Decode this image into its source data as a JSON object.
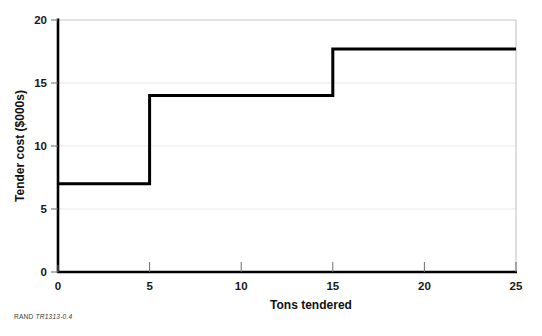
{
  "figure": {
    "source_note_prefix": "RAND",
    "source_note_id": "TR1313-0.4"
  },
  "chart_data": {
    "type": "line",
    "subtype": "step",
    "title": "",
    "xlabel": "Tons tendered",
    "ylabel": "Tender cost ($000s)",
    "xlim": [
      0,
      25
    ],
    "ylim": [
      0,
      20
    ],
    "xticks": [
      0,
      5,
      10,
      15,
      20,
      25
    ],
    "yticks": [
      0,
      5,
      10,
      15,
      20
    ],
    "xtick_labels": [
      "0",
      "5",
      "10",
      "15",
      "20",
      "25"
    ],
    "ytick_labels": [
      "0",
      "5",
      "10",
      "15",
      "20"
    ],
    "grid": "horizontal",
    "legend": "none",
    "series": [
      {
        "name": "Tender cost",
        "color": "#000000",
        "step_mode": "post",
        "x": [
          0,
          5,
          5,
          15,
          15,
          25
        ],
        "y": [
          7,
          7,
          14,
          14,
          17.7,
          17.7
        ],
        "breakpoints": [
          {
            "x_start": 0,
            "x_end": 5,
            "value": 7
          },
          {
            "x_start": 5,
            "x_end": 15,
            "value": 14
          },
          {
            "x_start": 15,
            "x_end": 25,
            "value": 17.7
          }
        ]
      }
    ],
    "colors": {
      "line": "#000000",
      "axis": "#000000",
      "grid": "#e4e4e4",
      "frame": "#b9b9b9",
      "background": "#ffffff"
    }
  }
}
